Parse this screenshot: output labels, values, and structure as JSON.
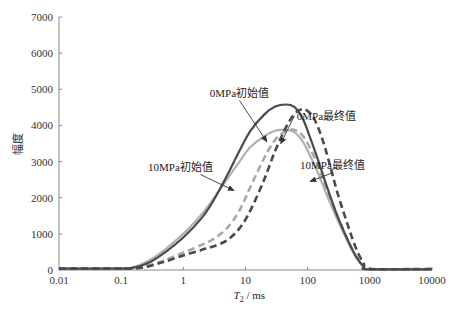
{
  "chart_data": {
    "type": "line",
    "title": "",
    "xlabel_italic": "T",
    "xlabel_sub": "2",
    "xlabel_rest": " / ms",
    "ylabel": "幅度",
    "xscale": "log",
    "xlim": [
      0.01,
      10000
    ],
    "ylim": [
      0,
      7000
    ],
    "xticks": [
      0.01,
      0.1,
      1,
      10,
      100,
      1000,
      10000
    ],
    "xtick_labels": [
      "0.01",
      "0.1",
      "1",
      "10",
      "100",
      "1000",
      "10000"
    ],
    "yticks": [
      0,
      1000,
      2000,
      3000,
      4000,
      5000,
      6000,
      7000
    ],
    "ytick_labels": [
      "0",
      "1000",
      "2000",
      "3000",
      "4000",
      "5000",
      "6000",
      "7000"
    ],
    "grid": false,
    "legend": "none (inline annotations)",
    "series": [
      {
        "name": "0MPa初始值",
        "style": "solid",
        "color": "#4a4a4a",
        "x": [
          0.01,
          0.1,
          0.15,
          0.2,
          0.3,
          0.5,
          1,
          2,
          3,
          5,
          8,
          12,
          20,
          30,
          45,
          60,
          80,
          100,
          150,
          200,
          300,
          450,
          600,
          800,
          950,
          10000
        ],
        "y": [
          40,
          40,
          60,
          110,
          230,
          480,
          900,
          1450,
          1900,
          2600,
          3300,
          3850,
          4300,
          4520,
          4580,
          4520,
          4250,
          3850,
          3000,
          2350,
          1500,
          800,
          380,
          90,
          20,
          20
        ]
      },
      {
        "name": "10MPa初始值",
        "style": "solid",
        "color": "#b0b0b0",
        "x": [
          0.01,
          0.1,
          0.15,
          0.2,
          0.3,
          0.5,
          1,
          2,
          3,
          5,
          8,
          12,
          20,
          30,
          45,
          60,
          80,
          100,
          150,
          200,
          300,
          450,
          600,
          800,
          950,
          10000
        ],
        "y": [
          40,
          40,
          70,
          140,
          290,
          560,
          1000,
          1550,
          1950,
          2500,
          3000,
          3400,
          3700,
          3850,
          3880,
          3820,
          3600,
          3300,
          2650,
          2100,
          1400,
          750,
          350,
          80,
          20,
          20
        ]
      },
      {
        "name": "0MPa最终值",
        "style": "dashed",
        "color": "#4a4a4a",
        "x": [
          0.01,
          0.1,
          0.2,
          0.3,
          0.5,
          1,
          2,
          3,
          5,
          8,
          12,
          20,
          30,
          45,
          60,
          80,
          100,
          130,
          170,
          220,
          300,
          450,
          600,
          800,
          1000,
          10000
        ],
        "y": [
          40,
          40,
          60,
          120,
          230,
          400,
          560,
          650,
          820,
          1150,
          1650,
          2500,
          3300,
          3950,
          4300,
          4450,
          4400,
          4150,
          3650,
          3000,
          2150,
          1200,
          600,
          180,
          30,
          30
        ]
      },
      {
        "name": "10MPa最终值",
        "style": "dashed",
        "color": "#a8a8a8",
        "x": [
          0.01,
          0.1,
          0.2,
          0.3,
          0.5,
          1,
          2,
          3,
          5,
          8,
          12,
          20,
          30,
          45,
          60,
          80,
          100,
          150,
          200,
          300,
          450,
          600,
          800,
          950,
          10000
        ],
        "y": [
          40,
          40,
          70,
          140,
          270,
          480,
          700,
          850,
          1150,
          1650,
          2300,
          3100,
          3600,
          3850,
          3880,
          3750,
          3500,
          2850,
          2250,
          1500,
          800,
          380,
          90,
          20,
          20
        ]
      }
    ],
    "annotations": [
      {
        "text": "0MPa初始值",
        "target_series": "0MPa初始值",
        "text_at": [
          8.0,
          4800
        ],
        "arrow_to": [
          22,
          3550
        ]
      },
      {
        "text": "0MPa最终值",
        "target_series": "0MPa最终值",
        "text_at": [
          200,
          4150
        ],
        "arrow_to": [
          37,
          3500
        ]
      },
      {
        "text": "10MPa初始值",
        "target_series": "10MPa初始值",
        "text_at": [
          0.9,
          2750
        ],
        "arrow_to": [
          6.5,
          2200
        ]
      },
      {
        "text": "10MPa最终值",
        "target_series": "10MPa最终值",
        "text_at": [
          250,
          2800
        ],
        "arrow_to": [
          110,
          2450
        ]
      }
    ]
  }
}
